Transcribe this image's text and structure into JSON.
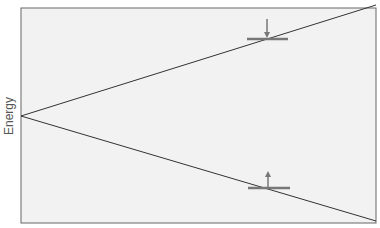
{
  "diagram": {
    "ylabel": "Energy",
    "colors": {
      "background": "#f2f2f2",
      "border": "#666666",
      "line": "#333333",
      "marker": "#777777"
    },
    "box": {
      "x": 21,
      "y": 8,
      "w": 355,
      "h": 215
    },
    "apex": {
      "x": 21,
      "y": 116
    },
    "upper_end": {
      "x": 376,
      "y": 5
    },
    "lower_end": {
      "x": 376,
      "y": 221
    },
    "markers": [
      {
        "name": "upper-level-marker",
        "x": 267,
        "y": 39,
        "arrow": "down"
      },
      {
        "name": "lower-level-marker",
        "x": 268,
        "y": 188,
        "arrow": "up"
      }
    ]
  }
}
